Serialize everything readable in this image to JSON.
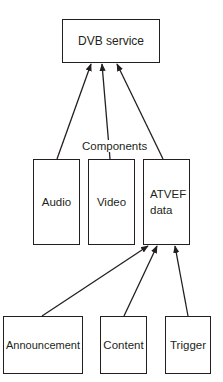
{
  "diagram": {
    "top": {
      "label": "DVB service"
    },
    "group_label": "Components",
    "components": [
      {
        "label": "Audio"
      },
      {
        "label": "Video"
      },
      {
        "label": "ATVEF\ndata",
        "line1": "ATVEF",
        "line2": "data"
      }
    ],
    "atvef_parts": [
      {
        "label": "Announcement"
      },
      {
        "label": "Content"
      },
      {
        "label": "Trigger"
      }
    ],
    "edges": [
      {
        "from": "Audio",
        "to": "DVB service"
      },
      {
        "from": "Video",
        "to": "DVB service"
      },
      {
        "from": "ATVEF data",
        "to": "DVB service"
      },
      {
        "from": "Announcement",
        "to": "ATVEF data"
      },
      {
        "from": "Content",
        "to": "ATVEF data"
      },
      {
        "from": "Trigger",
        "to": "ATVEF data"
      }
    ],
    "colors": {
      "stroke": "#231f20",
      "background": "#ffffff"
    }
  }
}
